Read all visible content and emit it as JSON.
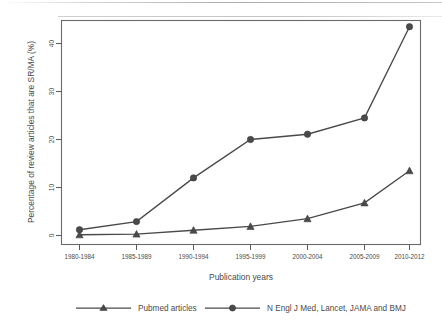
{
  "chart_data": {
    "type": "line",
    "title": "",
    "xlabel": "Publication years",
    "ylabel": "Percentage of review articles that are SR/MA (%)",
    "categories": [
      "1980-1984",
      "1985-1989",
      "1990-1994",
      "1995-1999",
      "2000-2004",
      "2005-2009",
      "2010-2012"
    ],
    "ylim": [
      0,
      45
    ],
    "yticks": [
      0,
      10,
      20,
      30,
      40
    ],
    "grid": false,
    "legend_position": "bottom",
    "series": [
      {
        "name": "Pubmed articles",
        "marker": "triangle",
        "color": "#4a4a4a",
        "values": [
          0.15,
          0.3,
          1.1,
          1.9,
          3.5,
          6.8,
          13.5
        ]
      },
      {
        "name": "N Engl J Med, Lancet, JAMA and BMJ",
        "marker": "circle",
        "color": "#4a4a4a",
        "values": [
          1.2,
          2.9,
          12.0,
          20.0,
          21.1,
          24.5,
          43.5
        ]
      }
    ]
  },
  "axis": {
    "y_label": "Percentage of review articles that are SR/MA (%)",
    "x_label": "Publication years",
    "y_tick_labels": [
      "0",
      "10",
      "20",
      "30",
      "40"
    ],
    "x_tick_labels": [
      "1980-1984",
      "1985-1989",
      "1990-1994",
      "1995-1999",
      "2000-2004",
      "2005-2009",
      "2010-2012"
    ]
  },
  "legend": {
    "items": [
      {
        "label": "Pubmed articles",
        "marker": "triangle-marker"
      },
      {
        "label": "N Engl J Med, Lancet, JAMA and BMJ",
        "marker": "circle-marker"
      }
    ]
  },
  "colors": {
    "line": "#4a4a4a",
    "axis": "#5b5b5b",
    "text": "#4a4a4a",
    "background": "#ffffff"
  }
}
